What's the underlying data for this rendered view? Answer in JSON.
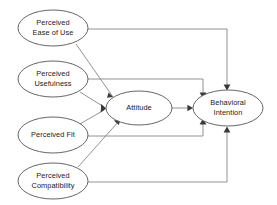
{
  "diagram": {
    "type": "path-diagram",
    "width": 277,
    "height": 205,
    "background_color": "#ffffff",
    "node_stroke_color": "#555555",
    "edge_stroke_color": "#777777",
    "text_color": "#1a1a1a",
    "nodes": [
      {
        "id": "peou",
        "name": "perceived-ease-of-use",
        "lines": [
          "Perceived",
          "Ease of Use"
        ],
        "cx": 53,
        "cy": 28,
        "rx": 35,
        "ry": 18
      },
      {
        "id": "pu",
        "name": "perceived-usefulness",
        "lines": [
          "Perceived",
          "Usefulness"
        ],
        "cx": 53,
        "cy": 79,
        "rx": 35,
        "ry": 18
      },
      {
        "id": "pfit",
        "name": "perceived-fit",
        "lines": [
          "Perceived Fit"
        ],
        "cx": 53,
        "cy": 135,
        "rx": 35,
        "ry": 18
      },
      {
        "id": "pcomp",
        "name": "perceived-compatibility",
        "lines": [
          "Perceived",
          "Compatibility"
        ],
        "cx": 53,
        "cy": 181,
        "rx": 35,
        "ry": 18
      },
      {
        "id": "att",
        "name": "attitude",
        "lines": [
          "Attitude"
        ],
        "cx": 139,
        "cy": 108,
        "rx": 33,
        "ry": 17
      },
      {
        "id": "bi",
        "name": "behavioral-intention",
        "lines": [
          "Behavioral",
          "Intention"
        ],
        "cx": 228,
        "cy": 108,
        "rx": 35,
        "ry": 18
      }
    ],
    "edges": [
      {
        "id": "peou-att",
        "name": "edge-ease-of-use-to-attitude",
        "from": "perceived-ease-of-use",
        "to": "attitude",
        "style": "diagonal",
        "path": "M 76,44 L 113,97",
        "head": "113,97 108.6,92.4 107.0,97.8"
      },
      {
        "id": "peou-bi",
        "name": "edge-ease-of-use-to-behavioral-intention",
        "from": "perceived-ease-of-use",
        "to": "behavioral-intention",
        "style": "orthogonal",
        "path": "M 88,29 L 227,29 L 227,89",
        "head": "227,90.5 223.6,84.6 230.4,84.6"
      },
      {
        "id": "pu-att",
        "name": "edge-usefulness-to-attitude",
        "from": "perceived-usefulness",
        "to": "attitude",
        "style": "diagonal",
        "path": "M 80,92 L 104,107",
        "head": "106,108.2 100.8,103.8 101.4,110.5"
      },
      {
        "id": "pu-bi",
        "name": "edge-usefulness-to-behavioral-intention",
        "from": "perceived-usefulness",
        "to": "behavioral-intention",
        "style": "orthogonal",
        "path": "M 88,79 L 203,79 L 203,97",
        "head": "203,98.5 199.6,92.6 206.4,92.6"
      },
      {
        "id": "pfit-att",
        "name": "edge-fit-to-attitude",
        "from": "perceived-fit",
        "to": "attitude",
        "style": "diagonal",
        "path": "M 80,124 L 104,110",
        "head": "106,108.8 101.2,105.8 100.6,112.5"
      },
      {
        "id": "pfit-bi",
        "name": "edge-fit-to-behavioral-intention",
        "from": "perceived-fit",
        "to": "behavioral-intention",
        "style": "orthogonal",
        "path": "M 88,136 L 203,136 L 203,120",
        "head": "203,118.5 199.6,124.4 206.4,124.4"
      },
      {
        "id": "pcomp-att",
        "name": "edge-compatibility-to-attitude",
        "from": "perceived-compatibility",
        "to": "attitude",
        "style": "diagonal",
        "path": "M 78,167 L 119,121",
        "head": "120.5,119.4 113.8,120.4 118.8,125.0"
      },
      {
        "id": "pcomp-bi",
        "name": "edge-compatibility-to-behavioral-intention",
        "from": "perceived-compatibility",
        "to": "behavioral-intention",
        "style": "orthogonal",
        "path": "M 88,182 L 227,182 L 227,128",
        "head": "227,126.5 223.6,132.4 230.4,132.4"
      },
      {
        "id": "att-bi",
        "name": "edge-attitude-to-behavioral-intention",
        "from": "attitude",
        "to": "behavioral-intention",
        "style": "straight",
        "path": "M 172,108 L 191,108",
        "head": "193,108 187.4,104.8 187.4,111.2"
      }
    ]
  }
}
